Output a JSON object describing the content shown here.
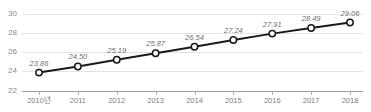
{
  "chart_data": {
    "type": "line",
    "title": "",
    "subtitle": "",
    "xlabel": "",
    "ylabel": "",
    "categories": [
      "2010년",
      "2011",
      "2012",
      "2013",
      "2014",
      "2015",
      "2016",
      "2017",
      "2018"
    ],
    "values": [
      23.86,
      24.5,
      25.19,
      25.87,
      26.54,
      27.24,
      27.91,
      28.49,
      29.06
    ],
    "point_labels": [
      "23.86",
      "24.50",
      "25.19",
      "25.87",
      "26.54",
      "27.24",
      "27.91",
      "28.49",
      "29.06"
    ],
    "ylim": [
      22,
      30
    ],
    "yticks": [
      22,
      24,
      26,
      28,
      30
    ],
    "ytick_labels": [
      "22",
      "24",
      "26",
      "28",
      "30"
    ],
    "grid": true,
    "legend": false,
    "legend_position": "none",
    "series": [
      {
        "name": "series-1",
        "values": [
          23.86,
          24.5,
          25.19,
          25.87,
          26.54,
          27.24,
          27.91,
          28.49,
          29.06
        ],
        "line_color": "#1a1a1a",
        "marker": "circle-open",
        "marker_fill": "#ffffff"
      }
    ],
    "colors": {
      "line": "#1a1a1a",
      "marker_fill": "#ffffff",
      "gridline": "#e3e3e3",
      "axis": "#9b9b9b",
      "tick_text": "#7d7d7d",
      "label_text": "#6e6e6e",
      "background": "#ffffff"
    }
  }
}
